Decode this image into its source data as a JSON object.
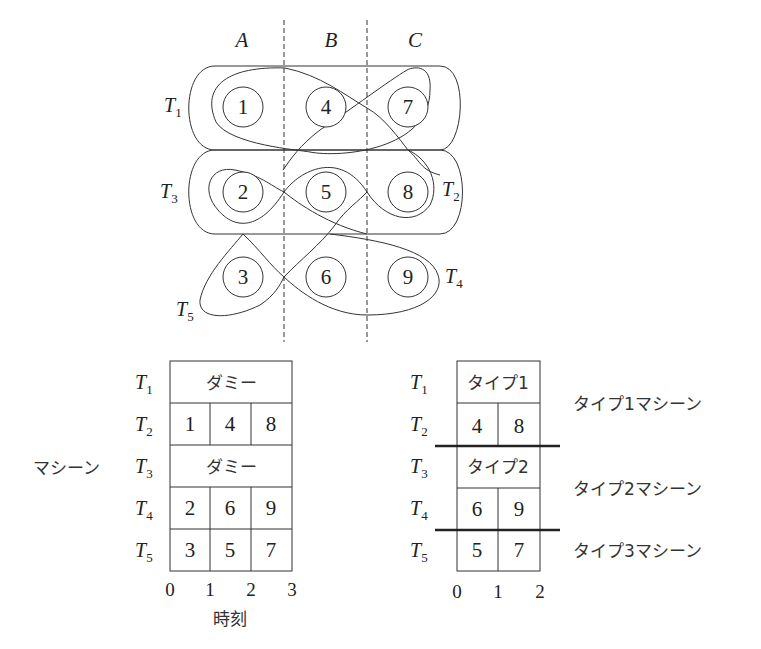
{
  "diagram": {
    "columns": [
      "A",
      "B",
      "C"
    ],
    "grid": [
      [
        "1",
        "4",
        "7"
      ],
      [
        "2",
        "5",
        "8"
      ],
      [
        "3",
        "6",
        "9"
      ]
    ],
    "loops": [
      {
        "label": "T",
        "sub": "1"
      },
      {
        "label": "T",
        "sub": "2"
      },
      {
        "label": "T",
        "sub": "3"
      },
      {
        "label": "T",
        "sub": "4"
      },
      {
        "label": "T",
        "sub": "5"
      }
    ]
  },
  "left_table": {
    "side_label": "マシーン",
    "rows": [
      {
        "label": "T",
        "sub": "1",
        "cells": [
          "ダミー"
        ]
      },
      {
        "label": "T",
        "sub": "2",
        "cells": [
          "1",
          "4",
          "8"
        ]
      },
      {
        "label": "T",
        "sub": "3",
        "cells": [
          "ダミー"
        ]
      },
      {
        "label": "T",
        "sub": "4",
        "cells": [
          "2",
          "6",
          "9"
        ]
      },
      {
        "label": "T",
        "sub": "5",
        "cells": [
          "3",
          "5",
          "7"
        ]
      }
    ],
    "axis_ticks": [
      "0",
      "1",
      "2",
      "3"
    ],
    "axis_label": "時刻"
  },
  "right_table": {
    "rows": [
      {
        "label": "T",
        "sub": "1",
        "cells": [
          "タイプ1"
        ]
      },
      {
        "label": "T",
        "sub": "2",
        "cells": [
          "4",
          "8"
        ]
      },
      {
        "label": "T",
        "sub": "3",
        "cells": [
          "タイプ2"
        ]
      },
      {
        "label": "T",
        "sub": "4",
        "cells": [
          "6",
          "9"
        ]
      },
      {
        "label": "T",
        "sub": "5",
        "cells": [
          "5",
          "7"
        ]
      }
    ],
    "groups": [
      "タイプ1マシーン",
      "タイプ2マシーン",
      "タイプ3マシーン"
    ],
    "axis_ticks": [
      "0",
      "1",
      "2"
    ]
  }
}
